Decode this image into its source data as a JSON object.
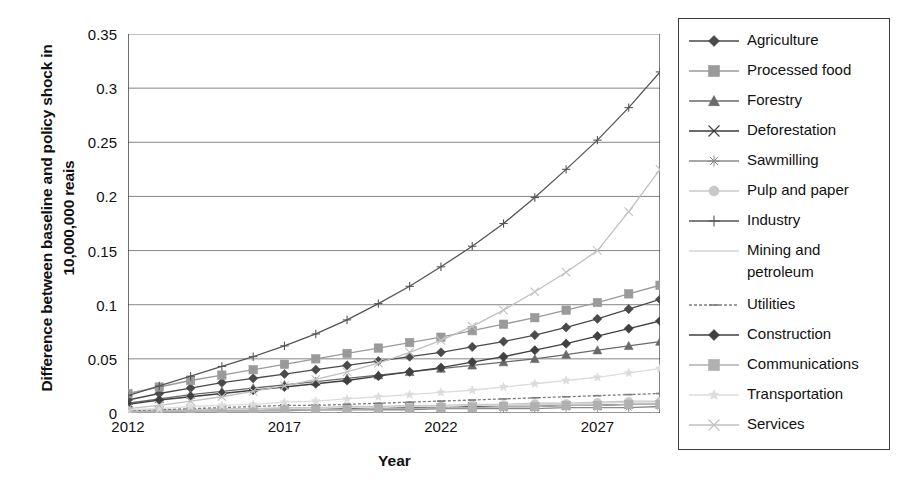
{
  "chart_data": {
    "type": "line",
    "title": "",
    "xlabel": "Year",
    "ylabel": "Difference between baseline and policy shock in 10,000,000 reais",
    "xlim": [
      2012,
      2029
    ],
    "ylim": [
      0,
      0.35
    ],
    "grid": true,
    "legend_position": "right",
    "x_tick_labels": [
      "2012",
      "2017",
      "2022",
      "2027"
    ],
    "x_tick_values": [
      2012,
      2017,
      2022,
      2027
    ],
    "y_tick_labels": [
      "0",
      "0.05",
      "0.1",
      "0.15",
      "0.2",
      "0.25",
      "0.3",
      "0.35"
    ],
    "y_tick_values": [
      0,
      0.05,
      0.1,
      0.15,
      0.2,
      0.25,
      0.3,
      0.35
    ],
    "x": [
      2012,
      2013,
      2014,
      2015,
      2016,
      2017,
      2018,
      2019,
      2020,
      2021,
      2022,
      2023,
      2024,
      2025,
      2026,
      2027,
      2028,
      2029
    ],
    "series": [
      {
        "name": "Agriculture",
        "marker": "diamond",
        "color": "#4a4a4a",
        "values": [
          0.012,
          0.018,
          0.023,
          0.028,
          0.032,
          0.036,
          0.04,
          0.044,
          0.048,
          0.052,
          0.056,
          0.061,
          0.066,
          0.072,
          0.079,
          0.087,
          0.096,
          0.105
        ]
      },
      {
        "name": "Processed food",
        "marker": "square",
        "color": "#9a9a9a",
        "values": [
          0.018,
          0.024,
          0.03,
          0.035,
          0.04,
          0.045,
          0.05,
          0.055,
          0.06,
          0.065,
          0.07,
          0.076,
          0.082,
          0.088,
          0.095,
          0.102,
          0.11,
          0.118
        ]
      },
      {
        "name": "Forestry",
        "marker": "triangle",
        "color": "#6a6a6a",
        "values": [
          0.009,
          0.013,
          0.017,
          0.02,
          0.023,
          0.026,
          0.029,
          0.032,
          0.035,
          0.038,
          0.041,
          0.044,
          0.047,
          0.05,
          0.054,
          0.058,
          0.062,
          0.066
        ]
      },
      {
        "name": "Deforestation",
        "marker": "x",
        "color": "#3a3a3a",
        "values": [
          0.002,
          0.002,
          0.003,
          0.003,
          0.003,
          0.004,
          0.004,
          0.004,
          0.005,
          0.005,
          0.005,
          0.006,
          0.006,
          0.006,
          0.007,
          0.007,
          0.008,
          0.008
        ]
      },
      {
        "name": "Sawmilling",
        "marker": "asterisk",
        "color": "#8a8a8a",
        "values": [
          0.001,
          0.001,
          0.002,
          0.002,
          0.002,
          0.002,
          0.003,
          0.003,
          0.003,
          0.003,
          0.004,
          0.004,
          0.004,
          0.004,
          0.005,
          0.005,
          0.005,
          0.006
        ]
      },
      {
        "name": "Pulp and paper",
        "marker": "circle",
        "color": "#c8c8c8",
        "values": [
          0.002,
          0.003,
          0.003,
          0.004,
          0.004,
          0.005,
          0.005,
          0.006,
          0.006,
          0.007,
          0.007,
          0.008,
          0.008,
          0.009,
          0.009,
          0.01,
          0.011,
          0.011
        ]
      },
      {
        "name": "Industry",
        "marker": "plus",
        "color": "#555555",
        "values": [
          0.016,
          0.025,
          0.034,
          0.043,
          0.052,
          0.062,
          0.073,
          0.086,
          0.101,
          0.117,
          0.135,
          0.154,
          0.175,
          0.199,
          0.225,
          0.252,
          0.282,
          0.315
        ]
      },
      {
        "name": "Mining and\npetroleum",
        "marker": "none",
        "color": "#d5d5d5",
        "values": [
          0.001,
          0.002,
          0.002,
          0.003,
          0.003,
          0.004,
          0.004,
          0.005,
          0.005,
          0.006,
          0.006,
          0.007,
          0.007,
          0.008,
          0.008,
          0.009,
          0.01,
          0.01
        ]
      },
      {
        "name": "Utilities",
        "marker": "dash",
        "color": "#7d7d7d",
        "values": [
          0.002,
          0.003,
          0.004,
          0.005,
          0.006,
          0.007,
          0.007,
          0.008,
          0.009,
          0.01,
          0.011,
          0.012,
          0.013,
          0.014,
          0.015,
          0.016,
          0.017,
          0.018
        ]
      },
      {
        "name": "Construction",
        "marker": "diamond",
        "color": "#404040",
        "values": [
          0.008,
          0.012,
          0.015,
          0.018,
          0.021,
          0.024,
          0.027,
          0.03,
          0.034,
          0.038,
          0.042,
          0.047,
          0.052,
          0.058,
          0.064,
          0.071,
          0.078,
          0.085
        ]
      },
      {
        "name": "Communications",
        "marker": "square",
        "color": "#b0b0b0",
        "values": [
          0.001,
          0.001,
          0.002,
          0.002,
          0.002,
          0.003,
          0.003,
          0.003,
          0.004,
          0.004,
          0.005,
          0.005,
          0.006,
          0.006,
          0.007,
          0.007,
          0.008,
          0.008
        ]
      },
      {
        "name": "Transportation",
        "marker": "star",
        "color": "#dcdcdc",
        "values": [
          0.003,
          0.004,
          0.006,
          0.007,
          0.008,
          0.01,
          0.011,
          0.013,
          0.015,
          0.017,
          0.019,
          0.021,
          0.024,
          0.027,
          0.03,
          0.033,
          0.037,
          0.041
        ]
      },
      {
        "name": "Services",
        "marker": "x",
        "color": "#c0c0c0",
        "values": [
          0.004,
          0.007,
          0.011,
          0.015,
          0.02,
          0.025,
          0.031,
          0.038,
          0.046,
          0.056,
          0.067,
          0.08,
          0.095,
          0.112,
          0.13,
          0.15,
          0.186,
          0.225
        ]
      }
    ]
  },
  "legend": {
    "items": [
      {
        "label": "Agriculture"
      },
      {
        "label": "Processed food"
      },
      {
        "label": "Forestry"
      },
      {
        "label": "Deforestation"
      },
      {
        "label": "Sawmilling"
      },
      {
        "label": "Pulp and paper"
      },
      {
        "label": "Industry"
      },
      {
        "label": "Mining and\npetroleum"
      },
      {
        "label": "Utilities"
      },
      {
        "label": "Construction"
      },
      {
        "label": "Communications"
      },
      {
        "label": "Transportation"
      },
      {
        "label": "Services"
      }
    ]
  },
  "axes": {
    "y_title": "Difference between baseline and policy shock in 10,000,000 reais",
    "x_title": "Year"
  },
  "colors": {
    "axis": "#333333",
    "grid": "#777777",
    "background": "#ffffff",
    "legend_border": "#3a3a3a"
  }
}
